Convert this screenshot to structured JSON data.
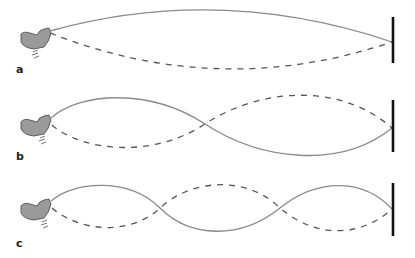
{
  "figure": {
    "panels": [
      {
        "label": "a",
        "mode": "fundamental",
        "half_waves": 1
      },
      {
        "label": "b",
        "mode": "second harmonic",
        "half_waves": 2
      },
      {
        "label": "c",
        "mode": "third harmonic",
        "half_waves": 3
      }
    ],
    "legend": {
      "solid_line": "string displacement (one extreme)",
      "dashed_line": "string displacement (opposite extreme)"
    },
    "colors": {
      "solid": "#8a8a8a",
      "dashed": "#555555",
      "hand": "#9a9a9a",
      "wall": "#111111"
    }
  }
}
